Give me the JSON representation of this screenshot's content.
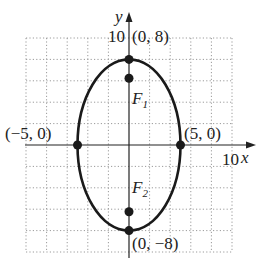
{
  "figure": {
    "type": "ellipse-graph",
    "colors": {
      "curve": "#1a1a1a",
      "axis": "#222222",
      "grid": "#9a9a9a",
      "point": "#1a1a1a",
      "background": "#ffffff"
    },
    "axes": {
      "x_label": "x",
      "y_label": "y",
      "x_tick_label": "10",
      "y_tick_label": "10",
      "xlim": [
        -10,
        10
      ],
      "ylim": [
        -10,
        10
      ],
      "grid_step": 2
    },
    "ellipse": {
      "center": [
        0,
        0
      ],
      "semi_major_vertical": 8,
      "semi_minor_horizontal": 5
    },
    "points": [
      {
        "name": "top-vertex",
        "coords": [
          0,
          8
        ],
        "label": "(0, 8)"
      },
      {
        "name": "bottom-vertex",
        "coords": [
          0,
          -8
        ],
        "label": "(0, −8)"
      },
      {
        "name": "left-vertex",
        "coords": [
          -5,
          0
        ],
        "label": "(−5, 0)"
      },
      {
        "name": "right-vertex",
        "coords": [
          5,
          0
        ],
        "label": "(5, 0)"
      },
      {
        "name": "focus-1",
        "coords": [
          0,
          6.24
        ],
        "label": "F",
        "subscript": "1"
      },
      {
        "name": "focus-2",
        "coords": [
          0,
          -6.24
        ],
        "label": "F",
        "subscript": "2"
      }
    ]
  }
}
